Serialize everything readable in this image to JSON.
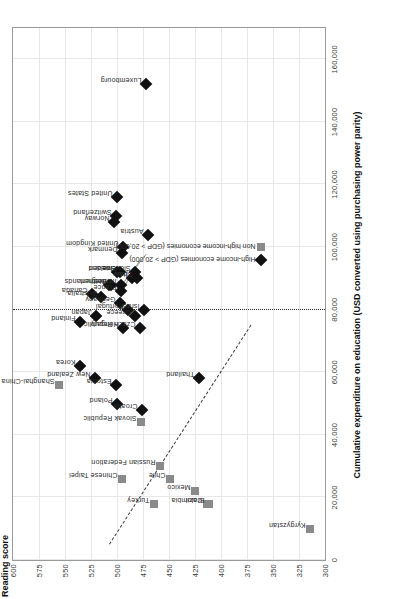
{
  "chart_data": {
    "type": "scatter",
    "title": "",
    "ylabel": "Reading score",
    "xlabel": "Cumulative expenditure on education (USD converted using purchasing power parity)",
    "ylim": [
      300,
      600
    ],
    "xlim": [
      0,
      170000
    ],
    "yticks": [
      "600",
      "575",
      "550",
      "525",
      "500",
      "475",
      "450",
      "425",
      "400",
      "375",
      "350",
      "325",
      "300"
    ],
    "ytick_values": [
      600,
      575,
      550,
      525,
      500,
      475,
      450,
      425,
      400,
      375,
      350,
      325,
      300
    ],
    "xticks": [
      "0",
      "20,000",
      "40,000",
      "60,000",
      "80,000",
      "100,000",
      "120,000",
      "140,000",
      "160,000"
    ],
    "xtick_values": [
      0,
      20000,
      40000,
      60000,
      80000,
      100000,
      120000,
      140000,
      160000
    ],
    "grid": true,
    "legend_position": "inside-right",
    "legend": [
      {
        "label": "High-income economies (GDP > 20,000)",
        "marker": "diamond",
        "color": "#111111"
      },
      {
        "label": "Non high-income economies (GDP > 20,000)",
        "marker": "square",
        "color": "#8a8a8a"
      }
    ],
    "annotations": [
      {
        "name": "trend-line",
        "style": "dashed",
        "note": "fitted regression line across all economies"
      },
      {
        "name": "mean-expenditure-line",
        "style": "dotted-vertical",
        "x": 80000,
        "note": "OECD average cumulative expenditure"
      }
    ],
    "series": [
      {
        "name": "High-income economies (GDP > 20,000)",
        "marker": "diamond",
        "color": "#111111",
        "points": [
          {
            "label": "Korea",
            "x": 62000,
            "y": 536
          },
          {
            "label": "Finland",
            "x": 76000,
            "y": 536
          },
          {
            "label": "Canada",
            "x": 85000,
            "y": 524
          },
          {
            "label": "New Zealand",
            "x": 58000,
            "y": 521
          },
          {
            "label": "Japan",
            "x": 78000,
            "y": 520
          },
          {
            "label": "Netherlands",
            "x": 88000,
            "y": 508
          },
          {
            "label": "Australia",
            "x": 84000,
            "y": 515
          },
          {
            "label": "Belgium",
            "x": 88000,
            "y": 506
          },
          {
            "label": "Norway",
            "x": 108000,
            "y": 503
          },
          {
            "label": "Iceland",
            "x": 92000,
            "y": 500
          },
          {
            "label": "Switzerland",
            "x": 110000,
            "y": 501
          },
          {
            "label": "United States",
            "x": 116000,
            "y": 500
          },
          {
            "label": "Germany",
            "x": 82000,
            "y": 497
          },
          {
            "label": "Sweden",
            "x": 92000,
            "y": 497
          },
          {
            "label": "Denmark",
            "x": 98000,
            "y": 495
          },
          {
            "label": "United Kingdom",
            "x": 100000,
            "y": 494
          },
          {
            "label": "Italy",
            "x": 90000,
            "y": 486
          },
          {
            "label": "Slovenia",
            "x": 92000,
            "y": 483
          },
          {
            "label": "Spain",
            "x": 90000,
            "y": 481
          },
          {
            "label": "Portugal",
            "x": 80000,
            "y": 489
          },
          {
            "label": "France",
            "x": 86000,
            "y": 496
          },
          {
            "label": "Ireland",
            "x": 88000,
            "y": 496
          },
          {
            "label": "Greece",
            "x": 78000,
            "y": 483
          },
          {
            "label": "Israel",
            "x": 80000,
            "y": 474
          },
          {
            "label": "Hungary",
            "x": 74000,
            "y": 494
          },
          {
            "label": "Estonia",
            "x": 56000,
            "y": 501
          },
          {
            "label": "Czech Republic",
            "x": 74000,
            "y": 478
          },
          {
            "label": "Poland",
            "x": 50000,
            "y": 500
          },
          {
            "label": "Croatia",
            "x": 48000,
            "y": 476
          },
          {
            "label": "Austria",
            "x": 104000,
            "y": 470
          },
          {
            "label": "Thailand",
            "x": 58000,
            "y": 421
          },
          {
            "label": "Luxembourg",
            "x": 152000,
            "y": 472
          }
        ]
      },
      {
        "name": "Non high-income economies (GDP > 20,000)",
        "marker": "square",
        "color": "#8a8a8a",
        "points": [
          {
            "label": "Shanghai-China",
            "x": 56000,
            "y": 556
          },
          {
            "label": "Chinese Taipei",
            "x": 26000,
            "y": 495
          },
          {
            "label": "Slovak Republic",
            "x": 44000,
            "y": 477
          },
          {
            "label": "Russian Federation",
            "x": 30000,
            "y": 459
          },
          {
            "label": "Turkey",
            "x": 18000,
            "y": 464
          },
          {
            "label": "Chile",
            "x": 26000,
            "y": 449
          },
          {
            "label": "Mexico",
            "x": 22000,
            "y": 425
          },
          {
            "label": "Colombia",
            "x": 18000,
            "y": 413
          },
          {
            "label": "Brazil",
            "x": 18000,
            "y": 412
          },
          {
            "label": "Kyrgyzstan",
            "x": 10000,
            "y": 314
          }
        ]
      }
    ]
  }
}
